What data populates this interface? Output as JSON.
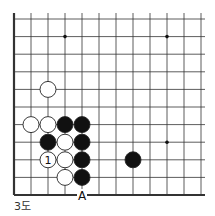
{
  "diagram": {
    "caption": "3도",
    "grid": {
      "cols": 12,
      "rows": 11,
      "x0": 14,
      "y0": 19,
      "dx": 17,
      "dy": 17.6,
      "left_edge": true,
      "bottom_edge": true
    },
    "star_points": [
      [
        3,
        1
      ],
      [
        9,
        1
      ],
      [
        9,
        7
      ]
    ],
    "stones": [
      {
        "color": "white",
        "col": 2,
        "row": 4
      },
      {
        "color": "white",
        "col": 1,
        "row": 6
      },
      {
        "color": "white",
        "col": 2,
        "row": 6
      },
      {
        "color": "black",
        "col": 3,
        "row": 6
      },
      {
        "color": "black",
        "col": 4,
        "row": 6
      },
      {
        "color": "black",
        "col": 2,
        "row": 7
      },
      {
        "color": "white",
        "col": 3,
        "row": 7
      },
      {
        "color": "black",
        "col": 4,
        "row": 7
      },
      {
        "color": "white",
        "col": 2,
        "row": 8,
        "label": "1"
      },
      {
        "color": "white",
        "col": 3,
        "row": 8
      },
      {
        "color": "black",
        "col": 4,
        "row": 8
      },
      {
        "color": "black",
        "col": 7,
        "row": 8
      },
      {
        "color": "white",
        "col": 3,
        "row": 9
      },
      {
        "color": "black",
        "col": 4,
        "row": 9
      }
    ],
    "markers": [
      {
        "label": "A",
        "col": 4,
        "row": 10
      }
    ]
  }
}
